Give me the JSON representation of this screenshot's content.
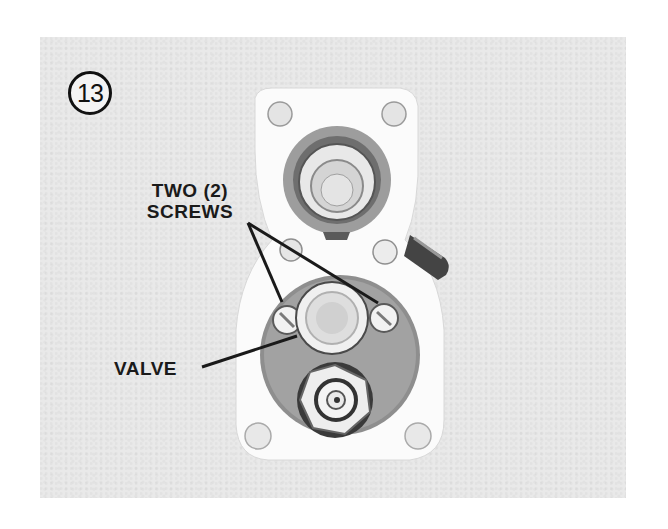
{
  "figure": {
    "number": "13",
    "labels": {
      "screws_line1": "TWO (2)",
      "screws_line2": "SCREWS",
      "valve": "VALVE"
    }
  }
}
